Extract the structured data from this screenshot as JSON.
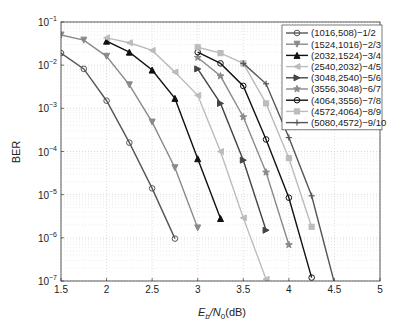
{
  "chart_data": {
    "type": "line",
    "title": "",
    "xlabel": "E_b/N_0(dB)",
    "ylabel": "BER",
    "xlim": [
      1.5,
      5
    ],
    "ylim": [
      1e-07,
      0.1
    ],
    "yscale": "log",
    "xticks": [
      "1.5",
      "2",
      "2.5",
      "3",
      "3.5",
      "4",
      "4.5",
      "5"
    ],
    "yticks": [
      "10^-1",
      "10^-2",
      "10^-3",
      "10^-4",
      "10^-5",
      "10^-6",
      "10^-7"
    ],
    "grid": true,
    "legend_position": "upper right",
    "series": [
      {
        "name": "(1016,508)−1/2",
        "color": "#555555",
        "marker": "circle-open",
        "x": [
          1.5,
          1.75,
          2.0,
          2.25,
          2.5,
          2.75
        ],
        "y": [
          0.019,
          0.0082,
          0.0015,
          0.00016,
          1.4e-05,
          9.6e-07
        ]
      },
      {
        "name": "(1524,1016)−2/3",
        "color": "#8a8a8a",
        "marker": "triangle-down",
        "x": [
          1.5,
          1.75,
          2.0,
          2.25,
          2.5,
          2.75,
          3.0
        ],
        "y": [
          0.05,
          0.038,
          0.016,
          0.0035,
          0.00048,
          4.2e-05,
          1.7e-06
        ]
      },
      {
        "name": "(2032,1524)−3/4",
        "color": "#111111",
        "marker": "triangle-up",
        "x": [
          2.0,
          2.25,
          2.5,
          2.75,
          3.0,
          3.25
        ],
        "y": [
          0.036,
          0.02,
          0.0077,
          0.0017,
          6.8e-05,
          2.8e-06
        ]
      },
      {
        "name": "(2540,2032)−4/5",
        "color": "#bcbcbc",
        "marker": "triangle-left",
        "x": [
          2.0,
          2.25,
          2.5,
          2.75,
          3.0,
          3.25,
          3.5,
          3.75
        ],
        "y": [
          0.043,
          0.033,
          0.022,
          0.0069,
          0.002,
          0.0001,
          2.9e-06,
          1.1e-07
        ]
      },
      {
        "name": "(3048,2540)−5/6",
        "color": "#444444",
        "marker": "triangle-right",
        "x": [
          3.0,
          3.25,
          3.5,
          3.75
        ],
        "y": [
          0.0082,
          0.0013,
          6.3e-05,
          1.5e-06
        ]
      },
      {
        "name": "(3556,3048)−6/7",
        "color": "#8a8a8a",
        "marker": "star",
        "x": [
          3.0,
          3.25,
          3.5,
          3.75,
          4.0
        ],
        "y": [
          0.015,
          0.0056,
          0.00063,
          3.3e-05,
          6.9e-07
        ]
      },
      {
        "name": "(4064,3556)−7/8",
        "color": "#111111",
        "marker": "circle-open",
        "x": [
          3.0,
          3.25,
          3.5,
          3.75,
          4.0,
          4.25
        ],
        "y": [
          0.02,
          0.011,
          0.0033,
          0.00019,
          8.5e-06,
          1.2e-07
        ]
      },
      {
        "name": "(4572,4064)−8/9",
        "color": "#bcbcbc",
        "marker": "square",
        "x": [
          3.0,
          3.25,
          3.5,
          3.75,
          4.0,
          4.25
        ],
        "y": [
          0.026,
          0.019,
          0.011,
          0.0013,
          7e-05,
          1.8e-06
        ]
      },
      {
        "name": "(5080,4572)−9/10",
        "color": "#555555",
        "marker": "plus",
        "x": [
          3.5,
          3.75,
          4.0,
          4.25,
          4.5
        ],
        "y": [
          0.011,
          0.0037,
          0.00021,
          9.4e-06,
          9e-08
        ]
      }
    ]
  },
  "axes": {
    "x_ticks": [
      "1.5",
      "2",
      "2.5",
      "3",
      "3.5",
      "4",
      "4.5",
      "5"
    ],
    "y_tick_base": "10",
    "y_tick_exponents": [
      "−1",
      "−2",
      "−3",
      "−4",
      "−5",
      "−6",
      "−7"
    ],
    "xlabel_main_E": "E",
    "xlabel_sub_b": "b",
    "xlabel_slash_N": "/N",
    "xlabel_sub_0": "0",
    "xlabel_unit": "(dB)",
    "ylabel": "BER"
  }
}
